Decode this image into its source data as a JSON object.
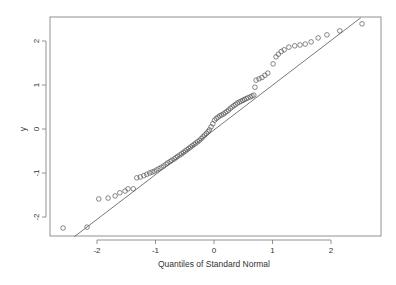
{
  "chart_data": {
    "type": "scatter",
    "title": "",
    "xlabel": "Quantiles of Standard Normal",
    "ylabel": "y",
    "xlim": [
      -2.8,
      2.85
    ],
    "ylim": [
      -2.45,
      2.7
    ],
    "x_ticks": [
      -2,
      -1,
      0,
      1,
      2
    ],
    "y_ticks": [
      -2,
      -1,
      0,
      1,
      2
    ],
    "x_tick_labels": [
      "-2",
      "-1",
      "0",
      "1",
      "2"
    ],
    "y_tick_labels": [
      "-2",
      "-1",
      "0",
      "1",
      "2"
    ],
    "grid": false,
    "legend": null,
    "marker": "open-circle",
    "reference_line": {
      "x": [
        -2.39,
        2.51
      ],
      "y": [
        -2.45,
        2.53
      ]
    },
    "points": {
      "x": [
        -2.58,
        -2.17,
        -1.97,
        -1.81,
        -1.69,
        -1.61,
        -1.52,
        -1.47,
        -1.38,
        -1.32,
        -1.26,
        -1.2,
        -1.15,
        -1.1,
        -1.06,
        -1.02,
        -0.98,
        -0.94,
        -0.9,
        -0.86,
        -0.82,
        -0.79,
        -0.75,
        -0.72,
        -0.68,
        -0.65,
        -0.62,
        -0.58,
        -0.55,
        -0.52,
        -0.49,
        -0.46,
        -0.43,
        -0.4,
        -0.37,
        -0.34,
        -0.31,
        -0.28,
        -0.25,
        -0.22,
        -0.19,
        -0.16,
        -0.13,
        -0.1,
        -0.08,
        -0.05,
        -0.02,
        0.01,
        0.04,
        0.07,
        0.1,
        0.13,
        0.16,
        0.19,
        0.22,
        0.25,
        0.28,
        0.31,
        0.34,
        0.37,
        0.4,
        0.43,
        0.46,
        0.49,
        0.52,
        0.55,
        0.58,
        0.62,
        0.65,
        0.68,
        0.7,
        0.72,
        0.77,
        0.82,
        0.87,
        0.92,
        1.01,
        1.06,
        1.1,
        1.15,
        1.2,
        1.28,
        1.38,
        1.47,
        1.56,
        1.66,
        1.78,
        1.93,
        2.15,
        2.53
      ],
      "y": [
        -2.25,
        -2.23,
        -1.59,
        -1.57,
        -1.52,
        -1.45,
        -1.41,
        -1.36,
        -1.36,
        -1.11,
        -1.09,
        -1.06,
        -1.03,
        -1.0,
        -0.98,
        -0.96,
        -0.93,
        -0.9,
        -0.87,
        -0.84,
        -0.8,
        -0.77,
        -0.74,
        -0.71,
        -0.68,
        -0.65,
        -0.62,
        -0.59,
        -0.56,
        -0.53,
        -0.5,
        -0.47,
        -0.44,
        -0.41,
        -0.38,
        -0.35,
        -0.32,
        -0.29,
        -0.26,
        -0.22,
        -0.18,
        -0.14,
        -0.1,
        -0.06,
        -0.02,
        0.05,
        0.12,
        0.2,
        0.24,
        0.27,
        0.3,
        0.32,
        0.34,
        0.37,
        0.4,
        0.43,
        0.47,
        0.5,
        0.53,
        0.56,
        0.59,
        0.61,
        0.63,
        0.65,
        0.67,
        0.69,
        0.71,
        0.73,
        0.75,
        0.77,
        0.95,
        1.11,
        1.14,
        1.17,
        1.22,
        1.27,
        1.48,
        1.64,
        1.7,
        1.76,
        1.8,
        1.86,
        1.89,
        1.91,
        1.93,
        1.98,
        2.07,
        2.14,
        2.23,
        2.39
      ]
    }
  }
}
